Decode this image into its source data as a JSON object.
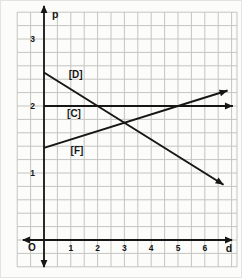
{
  "figure": {
    "background": "#fcfcfa",
    "grid_color": "#c4c4c1",
    "axis_color": "#161616",
    "line_color": "#161616",
    "text_color": "#161616"
  },
  "chart_data": {
    "type": "line",
    "title": "",
    "xlabel": "d",
    "ylabel": "p",
    "origin_label": "O",
    "xlim": [
      0,
      7.3
    ],
    "ylim": [
      0,
      3.5
    ],
    "x_ticks": [
      1,
      2,
      3,
      4,
      5,
      6
    ],
    "y_ticks": [
      1,
      2,
      3
    ],
    "grid": true,
    "legend_position": "inline-labels",
    "series": [
      {
        "name": "[D]",
        "points": [
          [
            0,
            2.5
          ],
          [
            6.7,
            0.825
          ]
        ],
        "slope": -0.25,
        "intercept": 2.5,
        "arrow_end": true,
        "label_pos": [
          1.18,
          2.47
        ]
      },
      {
        "name": "[C]",
        "points": [
          [
            0,
            2
          ],
          [
            7.05,
            2
          ]
        ],
        "slope": 0,
        "intercept": 2,
        "arrow_end": true,
        "label_pos": [
          1.12,
          1.89
        ]
      },
      {
        "name": "[F]",
        "points": [
          [
            0,
            1.375
          ],
          [
            6.85,
            2.231
          ]
        ],
        "slope": 0.125,
        "intercept": 1.375,
        "arrow_end": true,
        "label_pos": [
          1.23,
          1.33
        ]
      }
    ],
    "intersections": [
      {
        "between": "[D] and [C]",
        "d": 2,
        "p": 2
      },
      {
        "between": "[D] and [F]",
        "d": 3,
        "p": 1.75
      },
      {
        "between": "[F] and [C]",
        "d": 5,
        "p": 2
      }
    ]
  }
}
